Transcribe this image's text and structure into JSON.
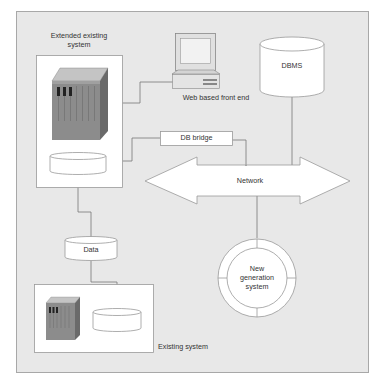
{
  "diagram": {
    "title": "",
    "colors": {
      "background": "#e8e8e8",
      "frame_border": "#a8a8a8",
      "box_fill": "#ffffff",
      "line": "#777777",
      "server_front": "#8c8c8c",
      "server_side": "#6a6a6a",
      "server_top": "#c4c4c4",
      "text": "#333333"
    },
    "nodes": {
      "extended_existing_system": {
        "label_line1": "Extended existing",
        "label_line2": "system"
      },
      "web_front_end": {
        "label": "Web based front end"
      },
      "dbms": {
        "label": "DBMS"
      },
      "db_bridge": {
        "label": "DB bridge"
      },
      "network": {
        "label": "Network"
      },
      "data": {
        "label": "Data"
      },
      "new_generation_system": {
        "label_line1": "New",
        "label_line2": "generation",
        "label_line3": "system"
      },
      "existing_system": {
        "label": "Existing system"
      }
    },
    "edges": [
      {
        "from": "extended_existing_system.server",
        "to": "web_front_end"
      },
      {
        "from": "extended_existing_system.database",
        "to": "db_bridge"
      },
      {
        "from": "db_bridge",
        "to": "network"
      },
      {
        "from": "dbms",
        "to": "network"
      },
      {
        "from": "network",
        "to": "new_generation_system"
      },
      {
        "from": "extended_existing_system.database",
        "to": "data"
      },
      {
        "from": "data",
        "to": "existing_system.database"
      }
    ]
  }
}
